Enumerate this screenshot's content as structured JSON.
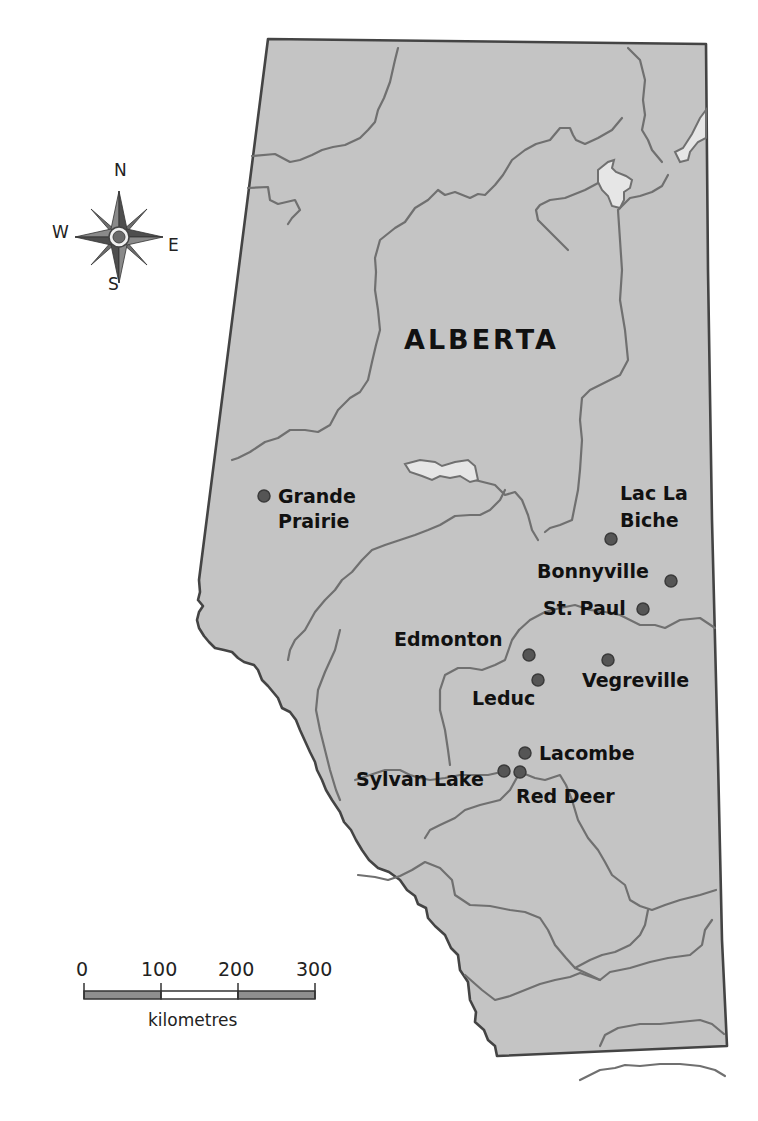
{
  "map": {
    "title": "ALBERTA",
    "colors": {
      "land": "#c4c4c4",
      "border": "#444444",
      "river": "#707070",
      "lake": "#e6e6e6",
      "city_dot": "#555555",
      "background": "#ffffff"
    },
    "cities": [
      {
        "name_line1": "Grande",
        "name_line2": "Prairie",
        "x": 264,
        "y": 496
      },
      {
        "name_line1": "Lac La",
        "name_line2": "Biche",
        "x": 611,
        "y": 539
      },
      {
        "name_line1": "Bonnyville",
        "x": 671,
        "y": 581
      },
      {
        "name_line1": "St. Paul",
        "x": 643,
        "y": 609
      },
      {
        "name_line1": "Edmonton",
        "x": 529,
        "y": 655
      },
      {
        "name_line1": "Leduc",
        "x": 538,
        "y": 680
      },
      {
        "name_line1": "Vegreville",
        "x": 608,
        "y": 660
      },
      {
        "name_line1": "Lacombe",
        "x": 525,
        "y": 753
      },
      {
        "name_line1": "Sylvan Lake",
        "x": 504,
        "y": 771
      },
      {
        "name_line1": "Red Deer",
        "x": 520,
        "y": 772
      }
    ]
  },
  "compass": {
    "north": "N",
    "south": "S",
    "east": "E",
    "west": "W"
  },
  "scale_bar": {
    "ticks": [
      "0",
      "100",
      "200",
      "300"
    ],
    "unit": "kilometres"
  }
}
